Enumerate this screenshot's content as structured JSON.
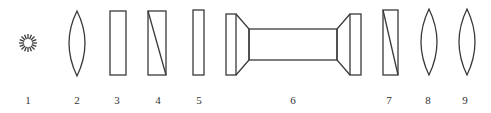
{
  "diagram": {
    "stroke_color": "#3a3a3a",
    "background": "#ffffff",
    "components": [
      {
        "id": "1",
        "label": "1",
        "shape": "light-source",
        "x": 28
      },
      {
        "id": "2",
        "label": "2",
        "shape": "convex-lens",
        "x": 77
      },
      {
        "id": "3",
        "label": "3",
        "shape": "plate",
        "x": 118
      },
      {
        "id": "4",
        "label": "4",
        "shape": "prism-plate-diagonal",
        "x": 157
      },
      {
        "id": "5",
        "label": "5",
        "shape": "thin-plate",
        "x": 199
      },
      {
        "id": "6",
        "label": "6",
        "shape": "tube-with-flanges",
        "x": 293
      },
      {
        "id": "7",
        "label": "7",
        "shape": "prism-plate-diagonal",
        "x": 390
      },
      {
        "id": "8",
        "label": "8",
        "shape": "convex-lens",
        "x": 429
      },
      {
        "id": "9",
        "label": "9",
        "shape": "convex-lens",
        "x": 467
      }
    ]
  }
}
